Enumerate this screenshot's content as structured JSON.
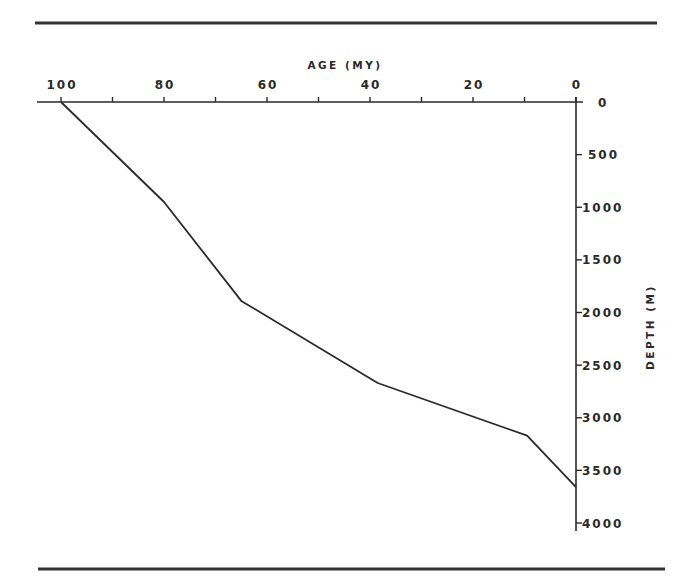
{
  "chart_data": {
    "type": "line",
    "title": "",
    "xlabel": "AGE (MY)",
    "ylabel": "DEPTH (M)",
    "x_axis_position": "top",
    "x_axis_reversed": true,
    "y_axis_position": "right",
    "y_axis_inverted": true,
    "xlim": [
      100,
      0
    ],
    "ylim": [
      0,
      4000
    ],
    "grid": false,
    "legend": null,
    "x_ticks": {
      "labeled": [
        100,
        80,
        60,
        40,
        20,
        0
      ],
      "minor": [
        90,
        70,
        50,
        30,
        10
      ]
    },
    "y_ticks": [
      0,
      500,
      1000,
      1500,
      2000,
      2500,
      3000,
      3500,
      4000
    ],
    "series": [
      {
        "name": "burial curve",
        "x": [
          100,
          80,
          65,
          38.5,
          9.5,
          0
        ],
        "y": [
          0,
          950,
          1890,
          2670,
          3170,
          3660
        ]
      }
    ],
    "colors": {
      "line": "#2a2a2a",
      "axis": "#2a2a2a",
      "rule": "#333333"
    }
  }
}
